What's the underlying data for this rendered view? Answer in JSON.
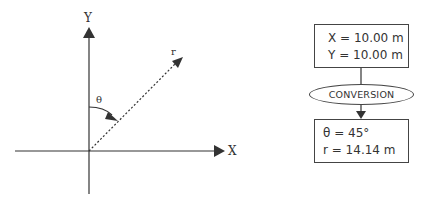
{
  "axes": {
    "x_label": "X",
    "y_label": "Y",
    "vector_label": "r",
    "angle_label": "θ"
  },
  "input_box": {
    "line1": "X = 10.00 m",
    "line2": "Y = 10.00 m"
  },
  "process": {
    "label": "CONVERSION"
  },
  "output_box": {
    "line1": "θ = 45°",
    "line2": "r = 14.14 m"
  },
  "colors": {
    "stroke": "#333333",
    "background": "#ffffff"
  }
}
